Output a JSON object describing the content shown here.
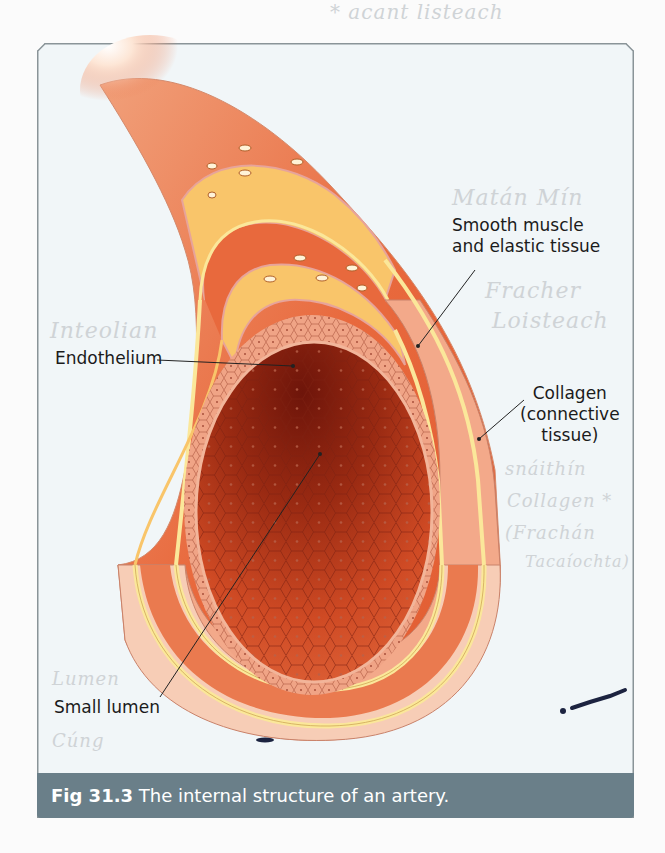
{
  "handwritten_notes": {
    "top": "* acant listeach",
    "smooth_muscle_irish": "Matán Mín",
    "elastic_irish_1": "Fracher",
    "elastic_irish_2": "Loisteach",
    "endothelium_irish": "Inteolian",
    "collagen_irish_1": "snáithín",
    "collagen_irish_2": "Collagen *",
    "collagen_irish_3": "(Frachán",
    "collagen_irish_4": "Tacaíochta)",
    "lumen_irish_1": "Lumen",
    "lumen_irish_2": "Cúng"
  },
  "labels": {
    "smooth_muscle_line1": "Smooth muscle",
    "smooth_muscle_line2": "and elastic tissue",
    "endothelium": "Endothelium",
    "collagen_line1": "Collagen",
    "collagen_line2": "(connective",
    "collagen_line3": "tissue)",
    "lumen": "Small lumen"
  },
  "caption": {
    "figure_number": "Fig 31.3",
    "text": "The internal structure of an artery."
  },
  "colors": {
    "frame_bg": "#f1f6f8",
    "caption_bg": "#6a7f89",
    "muscle": "#ea7a4f",
    "collagen": "#f3a98a",
    "outer_pale": "#f7cdb6",
    "elastic_yellow": "#fbe79a",
    "lumen_dark": "#7a1a0c",
    "lumen_mid": "#c2401e"
  }
}
